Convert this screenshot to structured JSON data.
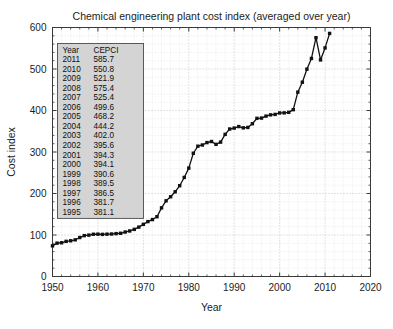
{
  "chart_data": {
    "type": "line",
    "title": "Chemical engineering plant cost index (averaged over year)",
    "xlabel": "Year",
    "ylabel": "Cost index",
    "xlim": [
      1950,
      2020
    ],
    "ylim": [
      0,
      600
    ],
    "xticks": [
      1950,
      1960,
      1970,
      1980,
      1990,
      2000,
      2010,
      2020
    ],
    "yticks": [
      0,
      100,
      200,
      300,
      400,
      500,
      600
    ],
    "xtick_labels": [
      "1950",
      "1960",
      "1970",
      "1980",
      "1990",
      "2000",
      "2010",
      "2020"
    ],
    "ytick_labels": [
      "0",
      "100",
      "200",
      "300",
      "400",
      "500",
      "600"
    ],
    "x_minor_step": 2,
    "y_minor_step": 20,
    "grid": true,
    "legend": "none",
    "marker": "square",
    "series": [
      {
        "name": "CEPCI",
        "x": [
          1950,
          1951,
          1952,
          1953,
          1954,
          1955,
          1956,
          1957,
          1958,
          1959,
          1960,
          1961,
          1962,
          1963,
          1964,
          1965,
          1966,
          1967,
          1968,
          1969,
          1970,
          1971,
          1972,
          1973,
          1974,
          1975,
          1976,
          1977,
          1978,
          1979,
          1980,
          1981,
          1982,
          1983,
          1984,
          1985,
          1986,
          1987,
          1988,
          1989,
          1990,
          1991,
          1992,
          1993,
          1994,
          1995,
          1996,
          1997,
          1998,
          1999,
          2000,
          2001,
          2002,
          2003,
          2004,
          2005,
          2006,
          2007,
          2008,
          2009,
          2010,
          2011
        ],
        "values": [
          73.9,
          80.4,
          81.3,
          84.7,
          86.1,
          88.3,
          93.9,
          98.5,
          99.7,
          101.8,
          102.0,
          101.5,
          102.0,
          102.4,
          103.3,
          104.2,
          107.2,
          109.7,
          113.6,
          119.0,
          125.7,
          132.3,
          137.2,
          144.1,
          165.4,
          182.4,
          192.1,
          204.1,
          218.8,
          238.7,
          261.2,
          297.0,
          314.0,
          316.9,
          322.7,
          325.3,
          318.4,
          323.8,
          342.5,
          355.4,
          357.6,
          361.3,
          358.2,
          359.2,
          368.1,
          381.1,
          381.7,
          386.5,
          389.5,
          390.6,
          394.1,
          394.3,
          395.6,
          402.0,
          444.2,
          468.2,
          499.6,
          525.4,
          575.4,
          521.9,
          550.8,
          585.7
        ]
      }
    ],
    "table": {
      "headers": [
        "Year",
        "CEPCI"
      ],
      "rows": [
        [
          "2011",
          "585.7"
        ],
        [
          "2010",
          "550.8"
        ],
        [
          "2009",
          "521.9"
        ],
        [
          "2008",
          "575.4"
        ],
        [
          "2007",
          "525.4"
        ],
        [
          "2006",
          "499.6"
        ],
        [
          "2005",
          "468.2"
        ],
        [
          "2004",
          "444.2"
        ],
        [
          "2003",
          "402.0"
        ],
        [
          "2002",
          "395.6"
        ],
        [
          "2001",
          "394.3"
        ],
        [
          "2000",
          "394.1"
        ],
        [
          "1999",
          "390.6"
        ],
        [
          "1998",
          "389.5"
        ],
        [
          "1997",
          "386.5"
        ],
        [
          "1996",
          "381.7"
        ],
        [
          "1995",
          "381.1"
        ]
      ]
    },
    "colors": {
      "line": "#111111",
      "grid": "#b9b9b9",
      "frame": "#3a3a3a",
      "table_fill": "#d4d4d4",
      "background": "#ffffff"
    }
  }
}
